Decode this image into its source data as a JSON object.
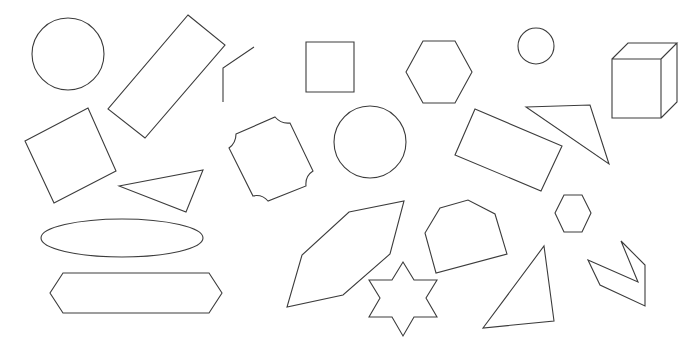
{
  "canvas": {
    "width": 700,
    "height": 353,
    "background": "#ffffff",
    "stroke": "#3c3c3c"
  },
  "shapes": [
    {
      "name": "circle-large-left",
      "type": "circle",
      "cx": 68,
      "cy": 54,
      "r": 36
    },
    {
      "name": "rotated-rectangle-tall",
      "type": "polygon",
      "points": "188,15 225,45 145,138 108,109"
    },
    {
      "name": "open-polyline-angle",
      "type": "polyline",
      "points": "254,47 223,68 223,102"
    },
    {
      "name": "square-axis-aligned",
      "type": "polygon",
      "points": "306,42 354,42 354,92 306,92"
    },
    {
      "name": "hexagon-top",
      "type": "polygon",
      "points": "423,41 455,41 472,72 455,103 423,103 406,72"
    },
    {
      "name": "circle-small",
      "type": "circle",
      "cx": 536,
      "cy": 46,
      "r": 18
    },
    {
      "name": "cube-3d",
      "type": "path",
      "d": "M612,59 L661,59 L661,118 L612,118 Z M612,59 L628,43 L677,43 L661,59 M677,43 L677,102 L661,118"
    },
    {
      "name": "rotated-square-left",
      "type": "polygon",
      "points": "25,141 88,108 116,171 54,203"
    },
    {
      "name": "notched-octagon",
      "type": "path",
      "d": "M236,134 L275,117 Q281,124 290,123 L313,171 Q305,176 306,186 L268,201 Q262,194 253,196 L229,148 Q236,143 236,134 Z"
    },
    {
      "name": "circle-middle",
      "type": "circle",
      "cx": 370,
      "cy": 142,
      "r": 36
    },
    {
      "name": "rotated-rectangle-right",
      "type": "polygon",
      "points": "475,109 562,146 541,191 455,155"
    },
    {
      "name": "triangle-right-top",
      "type": "polygon",
      "points": "526,107 590,105 609,164"
    },
    {
      "name": "triangle-left-middle",
      "type": "polygon",
      "points": "119,186 203,170 186,212"
    },
    {
      "name": "ellipse-wide",
      "type": "ellipse",
      "cx": 122,
      "cy": 238,
      "rx": 81,
      "ry": 19
    },
    {
      "name": "elongated-hexagon",
      "type": "polygon",
      "points": "63,273 209,273 222,293 209,313 63,313 50,293"
    },
    {
      "name": "slanted-hexagon",
      "type": "polygon",
      "points": "349,212 404,201 390,254 343,295 287,307 302,255"
    },
    {
      "name": "six-point-star",
      "type": "polygon",
      "points": "403,262 414,280 437,280 426,298 437,317 414,317 403,336 392,317 369,317 380,298 369,280 392,280"
    },
    {
      "name": "irregular-hexagon",
      "type": "polygon",
      "points": "440,208 468,200 495,214 507,254 436,273 425,233"
    },
    {
      "name": "hexagon-small",
      "type": "polygon",
      "points": "564,195 582,195 591,213 582,232 564,232 555,213"
    },
    {
      "name": "triangle-bottom",
      "type": "polygon",
      "points": "544,246 554,321 483,328"
    },
    {
      "name": "chevron-shape",
      "type": "polygon",
      "points": "588,260 638,282 621,241 645,265 645,306 600,285"
    }
  ]
}
